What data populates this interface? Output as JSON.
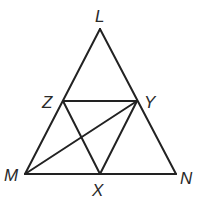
{
  "diagram": {
    "type": "geometry-triangle",
    "colors": {
      "line": "#222222",
      "label": "#2a2a2a",
      "background": "#ffffff"
    },
    "points": {
      "L": {
        "label": "L",
        "x": 100,
        "y": 29
      },
      "Z": {
        "label": "Z",
        "x": 63,
        "y": 101
      },
      "Y": {
        "label": "Y",
        "x": 137,
        "y": 101
      },
      "M": {
        "label": "M",
        "x": 25,
        "y": 174
      },
      "X": {
        "label": "X",
        "x": 100,
        "y": 174
      },
      "N": {
        "label": "N",
        "x": 176,
        "y": 174
      }
    },
    "segments": [
      [
        "L",
        "M"
      ],
      [
        "L",
        "N"
      ],
      [
        "M",
        "N"
      ],
      [
        "Z",
        "Y"
      ],
      [
        "Z",
        "X"
      ],
      [
        "Y",
        "X"
      ],
      [
        "M",
        "Y"
      ]
    ]
  }
}
